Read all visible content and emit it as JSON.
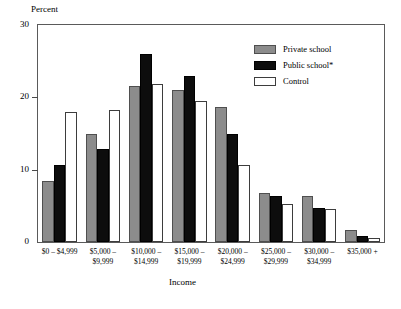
{
  "chart_data": {
    "type": "bar",
    "title": "",
    "xlabel": "Income",
    "ylabel": "Percent",
    "ylim": [
      0,
      30
    ],
    "yticks": [
      0,
      10,
      20,
      30
    ],
    "ytick_labels": [
      "0",
      "10",
      "20",
      "30"
    ],
    "grid": false,
    "legend_position": "top-right",
    "categories": [
      "$0 – $4,999",
      "$5,000 –\n$9,999",
      "$10,000 –\n$14,999",
      "$15,000 –\n$19,999",
      "$20,000 –\n$24,999",
      "$25,000 –\n$29,999",
      "$30,000 –\n$34,999",
      "$35,000 +"
    ],
    "series": [
      {
        "name": "Private school",
        "color": "#8c8c8c",
        "values": [
          8.5,
          15.0,
          21.5,
          21.0,
          18.7,
          6.8,
          6.3,
          1.6
        ]
      },
      {
        "name": "Public school*",
        "color": "#0d0d0d",
        "values": [
          10.7,
          12.8,
          26.0,
          23.0,
          15.0,
          6.3,
          4.7,
          0.8
        ]
      },
      {
        "name": "Control",
        "color": "#ffffff",
        "values": [
          18.0,
          18.3,
          21.8,
          19.5,
          10.6,
          5.3,
          4.5,
          0.6
        ]
      }
    ]
  },
  "axes": {
    "y_title": "Percent",
    "x_title": "Income",
    "y_tick_labels": [
      "30",
      "20",
      "10",
      "0"
    ]
  },
  "legend": {
    "items": [
      {
        "label": "Private school",
        "swatch": "private"
      },
      {
        "label": "Public school*",
        "swatch": "public"
      },
      {
        "label": "Control",
        "swatch": "control"
      }
    ]
  }
}
